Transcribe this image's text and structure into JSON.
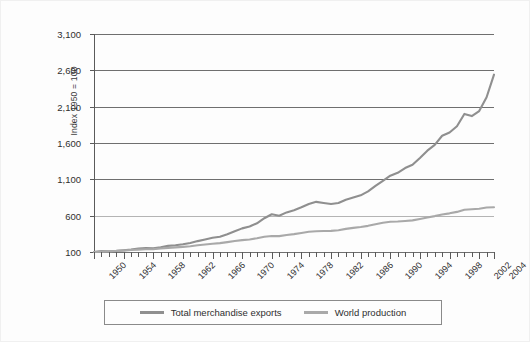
{
  "chart_data": {
    "type": "line",
    "title": "",
    "xlabel": "",
    "ylabel": "Index 1950 = 100",
    "xlim": [
      1950,
      2004
    ],
    "ylim": [
      100,
      3100
    ],
    "yticks": [
      100,
      600,
      1100,
      1600,
      2100,
      2600,
      3100
    ],
    "ytick_labels": [
      "100",
      "600",
      "1,100",
      "1,600",
      "2,100",
      "2,600",
      "3,100"
    ],
    "xticks": [
      1950,
      1954,
      1958,
      1962,
      1966,
      1970,
      1974,
      1978,
      1982,
      1986,
      1990,
      1994,
      1998,
      2002,
      2004
    ],
    "xtick_labels": [
      "1950",
      "1954",
      "1958",
      "1962",
      "1966",
      "1970",
      "1974",
      "1978",
      "1982",
      "1986",
      "1990",
      "1994",
      "1998",
      "2002",
      "2004"
    ],
    "x_minor_tick_interval": 1,
    "grid": true,
    "grid_axis": "y",
    "legend_position": "bottom",
    "x": [
      1950,
      1951,
      1952,
      1953,
      1954,
      1955,
      1956,
      1957,
      1958,
      1959,
      1960,
      1961,
      1962,
      1963,
      1964,
      1965,
      1966,
      1967,
      1968,
      1969,
      1970,
      1971,
      1972,
      1973,
      1974,
      1975,
      1976,
      1977,
      1978,
      1979,
      1980,
      1981,
      1982,
      1983,
      1984,
      1985,
      1986,
      1987,
      1988,
      1989,
      1990,
      1991,
      1992,
      1993,
      1994,
      1995,
      1996,
      1997,
      1998,
      1999,
      2000,
      2001,
      2002,
      2003,
      2004
    ],
    "series": [
      {
        "name": "Total merchandise exports",
        "color": "#8f8f8f",
        "values": [
          100,
          112,
          111,
          116,
          124,
          134,
          147,
          153,
          152,
          166,
          184,
          193,
          206,
          224,
          250,
          272,
          295,
          310,
          345,
          385,
          425,
          450,
          495,
          565,
          620,
          600,
          645,
          675,
          715,
          760,
          790,
          775,
          760,
          775,
          820,
          850,
          880,
          935,
          1010,
          1080,
          1150,
          1190,
          1255,
          1300,
          1395,
          1495,
          1575,
          1700,
          1745,
          1830,
          2000,
          1970,
          2040,
          2230,
          2540
        ]
      },
      {
        "name": "World production",
        "color": "#a9a9a9",
        "values": [
          100,
          105,
          108,
          113,
          119,
          127,
          132,
          137,
          140,
          148,
          157,
          163,
          171,
          180,
          192,
          203,
          214,
          222,
          236,
          251,
          263,
          273,
          289,
          310,
          320,
          318,
          334,
          346,
          362,
          379,
          386,
          390,
          391,
          400,
          418,
          432,
          444,
          460,
          483,
          503,
          517,
          520,
          527,
          535,
          555,
          576,
          594,
          617,
          632,
          652,
          682,
          688,
          696,
          712,
          715
        ]
      }
    ]
  },
  "legend": {
    "items": [
      {
        "label": "Total merchandise exports",
        "color": "#8f8f8f"
      },
      {
        "label": "World production",
        "color": "#a9a9a9"
      }
    ]
  }
}
